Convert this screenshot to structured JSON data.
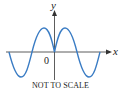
{
  "diagram": {
    "function_description": "even oscillating curve y = sin|x| shape",
    "curve_color": "#3a7cc4",
    "axis_color": "#333333",
    "labels": {
      "y_axis": "y",
      "x_axis": "x",
      "origin": "0"
    },
    "caption": "NOT TO SCALE"
  }
}
